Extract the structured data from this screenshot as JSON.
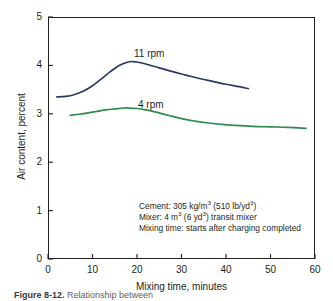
{
  "chart_data": {
    "type": "line",
    "title": "",
    "xlabel": "Mixing time, minutes",
    "ylabel": "Air content, percent",
    "xlim": [
      0,
      60
    ],
    "ylim": [
      0,
      5
    ],
    "xticks": [
      0,
      10,
      20,
      30,
      40,
      50,
      60
    ],
    "yticks": [
      0,
      1,
      2,
      3,
      4,
      5
    ],
    "xtick_labels": [
      "0",
      "10",
      "20",
      "30",
      "40",
      "50",
      "60"
    ],
    "ytick_labels": [
      "0",
      "1",
      "2",
      "3",
      "4",
      "5"
    ],
    "grid": false,
    "legend_position": "inline-curve-labels",
    "series": [
      {
        "name": "11 rpm",
        "color": "#2b3a67",
        "label_x": 25,
        "label_y": 4.35,
        "x": [
          2,
          4,
          6,
          8,
          10,
          12,
          14,
          16,
          18,
          19,
          20,
          22,
          25,
          28,
          31,
          34,
          37,
          40,
          43,
          45
        ],
        "y": [
          3.35,
          3.36,
          3.4,
          3.47,
          3.58,
          3.72,
          3.87,
          4.0,
          4.07,
          4.08,
          4.07,
          4.03,
          3.95,
          3.87,
          3.8,
          3.73,
          3.67,
          3.61,
          3.56,
          3.52
        ]
      },
      {
        "name": "4 rpm",
        "color": "#2e8b4f",
        "label_x": 26,
        "label_y": 3.38,
        "x": [
          5,
          7,
          9,
          11,
          13,
          15,
          17,
          18,
          20,
          22,
          24,
          27,
          30,
          33,
          36,
          39,
          42,
          46,
          50,
          54,
          58
        ],
        "y": [
          2.97,
          2.99,
          3.02,
          3.05,
          3.08,
          3.1,
          3.12,
          3.12,
          3.11,
          3.08,
          3.04,
          2.97,
          2.9,
          2.85,
          2.81,
          2.78,
          2.76,
          2.74,
          2.73,
          2.72,
          2.7
        ]
      }
    ],
    "annotations": [
      {
        "line": "Cement: 305 kg/m3 (510 lb/yd3)"
      },
      {
        "line": "Mixer: 4 m3 (6 yd3) transit mixer"
      },
      {
        "line": "Mixing time: starts after charging completed"
      }
    ]
  },
  "annotation_note": {
    "line1": {
      "pre": "Cement: 305 kg/m",
      "sup1": "3",
      "mid": " (510 lb/yd",
      "sup2": "3",
      "post": ")"
    },
    "line2": {
      "pre": "Mixer: 4 m",
      "sup1": "3",
      "mid": " (6 yd",
      "sup2": "3",
      "post": ") transit mixer"
    },
    "line3": {
      "text": "Mixing time: starts after charging completed"
    }
  },
  "caption": {
    "number": "Figure  8-12.",
    "text": "Relationship between"
  },
  "colors": {
    "axis": "#231f20",
    "series_11rpm": "#2b3a67",
    "series_4rpm": "#2e8b4f",
    "background": "#ffffff"
  }
}
